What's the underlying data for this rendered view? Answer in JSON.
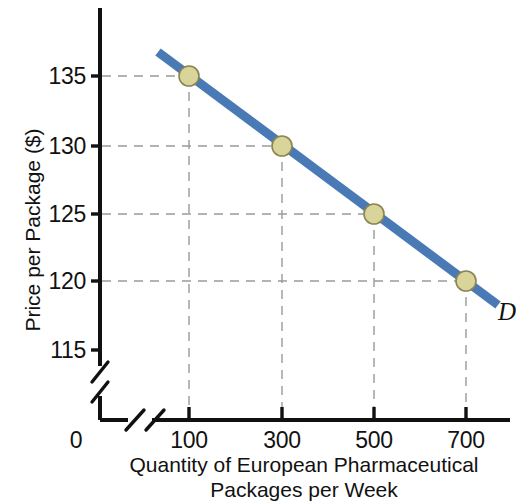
{
  "chart_data": {
    "type": "line",
    "title": "",
    "subtitle": "",
    "xlabel_line1": "Quantity of European Pharmaceutical",
    "xlabel_line2": "Packages per Week",
    "ylabel": "Price per Package ($)",
    "series": [
      {
        "name": "D",
        "label": "D",
        "color": "#4a7ab5",
        "marker_fill": "#d8d49a",
        "marker_edge": "#8a8452",
        "x": [
          100,
          300,
          500,
          700
        ],
        "values": [
          135,
          130,
          125,
          120
        ]
      }
    ],
    "points": [
      {
        "x": 100,
        "y": 135
      },
      {
        "x": 300,
        "y": 130
      },
      {
        "x": 500,
        "y": 125
      },
      {
        "x": 700,
        "y": 120
      }
    ],
    "xticks": [
      100,
      300,
      500,
      700
    ],
    "xtick_labels": [
      "100",
      "300",
      "500",
      "700"
    ],
    "yticks": [
      115,
      120,
      125,
      130,
      135
    ],
    "ytick_labels": [
      "115",
      "120",
      "125",
      "130",
      "135"
    ],
    "origin_label": "0",
    "xlim": [
      0,
      760
    ],
    "ylim": [
      113,
      139
    ],
    "grid": "dashed-guides-to-points",
    "grid_color": "#9a9a9a",
    "axis_break_x": true,
    "axis_break_y": true,
    "legend_position": "inline-end-of-line",
    "axis_color": "#111111"
  },
  "colors": {
    "line": "#4a7ab5",
    "marker_fill": "#d8d49a",
    "marker_edge": "#8a8452",
    "axis": "#111111",
    "grid": "#9a9a9a",
    "background": "#ffffff"
  },
  "geometry": {
    "x_positions": [
      189,
      282,
      374,
      466
    ],
    "y_positions": [
      350,
      281,
      214,
      146,
      76
    ],
    "axis_x": 100,
    "axis_y": 420,
    "line_start": {
      "x": 158,
      "y": 52
    },
    "line_end": {
      "x": 498,
      "y": 305
    }
  }
}
